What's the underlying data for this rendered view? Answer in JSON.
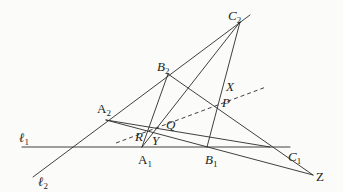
{
  "diagram": {
    "type": "geometry-construction",
    "lines": [
      {
        "name": "l1",
        "from": [
          22,
          147
        ],
        "to": [
          290,
          147
        ],
        "style": "solid"
      },
      {
        "name": "l2",
        "from": [
          33,
          177
        ],
        "to": [
          250,
          15
        ],
        "style": "solid"
      }
    ],
    "labels": {
      "l1": {
        "base": "ℓ",
        "sub": "1"
      },
      "l2": {
        "base": "ℓ",
        "sub": "2"
      },
      "A1": {
        "base": "A",
        "sub": "1"
      },
      "B1": {
        "base": "B",
        "sub": "1"
      },
      "C1": {
        "base": "C",
        "sub": "1"
      },
      "A2": {
        "base": "A",
        "sub": "2"
      },
      "B2": {
        "base": "B",
        "sub": "2"
      },
      "C2": {
        "base": "C",
        "sub": "2"
      },
      "X": {
        "base": "X"
      },
      "Y": {
        "base": "Y"
      },
      "Z": {
        "base": "Z"
      },
      "P": {
        "base": "P"
      },
      "Q": {
        "base": "Q"
      },
      "R": {
        "base": "R"
      }
    },
    "points": {
      "A1": [
        142,
        147
      ],
      "B1": [
        207,
        147
      ],
      "C1": [
        270,
        147
      ],
      "A2": [
        106,
        120
      ],
      "B2": [
        168,
        74
      ],
      "C2": [
        240,
        22
      ],
      "Z": [
        313,
        175
      ],
      "P": [
        216,
        108
      ]
    },
    "colors": {
      "line": "#2a2a2a",
      "background": "#fbfbf9"
    }
  }
}
